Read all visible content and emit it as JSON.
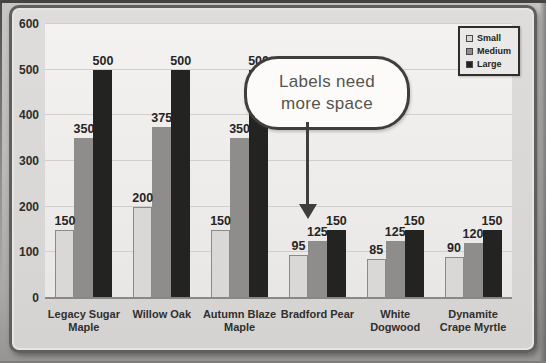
{
  "chart_data": {
    "type": "bar",
    "categories": [
      "Legacy Sugar\nMaple",
      "Willow Oak",
      "Autumn Blaze\nMaple",
      "Bradford Pear",
      "White\nDogwood",
      "Dynamite\nCrape Myrtle"
    ],
    "series": [
      {
        "name": "Small",
        "values": [
          150,
          200,
          150,
          95,
          85,
          90
        ]
      },
      {
        "name": "Medium",
        "values": [
          350,
          375,
          350,
          125,
          125,
          120
        ]
      },
      {
        "name": "Large",
        "values": [
          500,
          500,
          500,
          150,
          150,
          150
        ]
      }
    ],
    "series_colors": [
      "#d9d8d6",
      "#8e8d8b",
      "#232321"
    ],
    "title": "",
    "xlabel": "",
    "ylabel": "",
    "ylim": [
      0,
      600
    ],
    "yticks": [
      0,
      100,
      200,
      300,
      400,
      500,
      600
    ],
    "grid": true,
    "data_labels": true,
    "legend_position": "top-right",
    "annotation": {
      "text": "Labels need more space",
      "target_category": "Bradford Pear"
    }
  }
}
